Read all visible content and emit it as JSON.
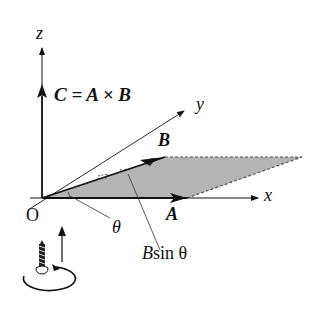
{
  "diagram": {
    "axes": {
      "z_label": "z",
      "y_label": "y",
      "x_label": "x",
      "origin_label": "O"
    },
    "vectors": {
      "C_label": "C = A × B",
      "C_parts": [
        "C",
        "=",
        "A",
        "×",
        "B"
      ],
      "B_label": "B",
      "A_label": "A"
    },
    "annotations": {
      "angle_label": "θ",
      "height_label_B": "B",
      "height_label_rest": "sin θ"
    },
    "colors": {
      "ink": "#111111",
      "shade": "#b4b4b4",
      "background": "#ffffff"
    },
    "right_hand_screw_icon": "screw-rotation-icon"
  }
}
